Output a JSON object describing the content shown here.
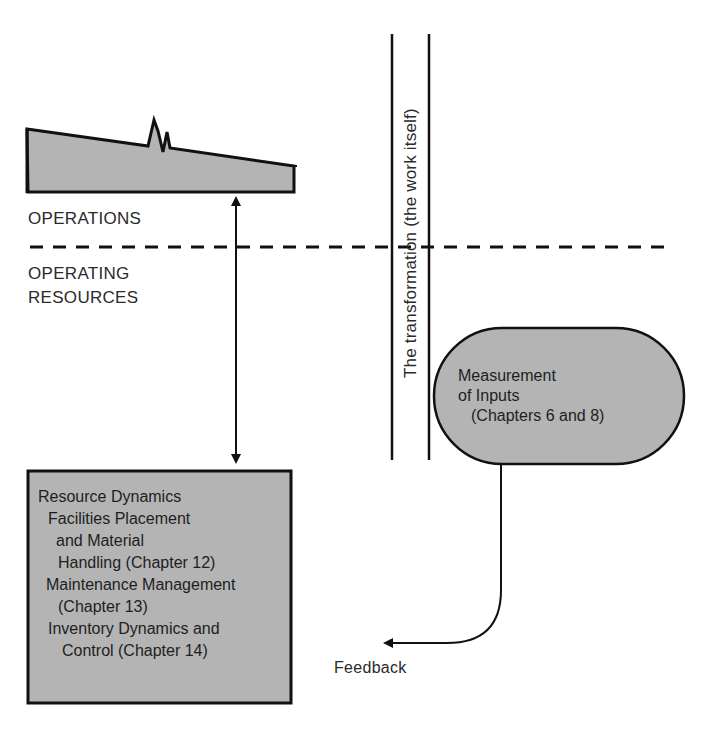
{
  "diagram": {
    "operations_label": "OPERATIONS",
    "operating_resources_label": [
      "OPERATING",
      "RESOURCES"
    ],
    "transformation_label": "The transformation (the work itself)",
    "measurement_box": {
      "lines": [
        "Measurement",
        "of Inputs",
        "(Chapters 6 and 8)"
      ]
    },
    "resource_box": {
      "lines": [
        "Resource Dynamics",
        "Facilities Placement",
        "and Material",
        "Handling (Chapter 12)",
        "Maintenance Management",
        "(Chapter 13)",
        "Inventory Dynamics and",
        "Control (Chapter 14)"
      ]
    },
    "feedback_label": "Feedback",
    "colors": {
      "fill_gray": "#b4b4b4",
      "stroke": "#111111",
      "background": "#ffffff"
    }
  }
}
